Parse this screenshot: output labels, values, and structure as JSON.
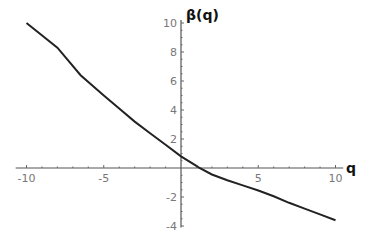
{
  "chart_data": {
    "type": "line",
    "title": "",
    "xlabel": "q",
    "ylabel": "β(q)",
    "xlim": [
      -10,
      10
    ],
    "ylim": [
      -4,
      10
    ],
    "grid": false,
    "legend": null,
    "x_ticks": [
      "-10",
      "-5",
      "5",
      "10"
    ],
    "y_ticks": [
      "10",
      "8",
      "6",
      "4",
      "2",
      "-2",
      "-4"
    ],
    "series": [
      {
        "name": "β(q)",
        "x": [
          -10,
          -8,
          -6.5,
          -5,
          -4,
          -3,
          -2,
          -1,
          0,
          1,
          1.2,
          2,
          3,
          4,
          5,
          6,
          7,
          8,
          9,
          10
        ],
        "y": [
          10,
          8.3,
          6.4,
          5.0,
          4.1,
          3.2,
          2.4,
          1.6,
          0.8,
          0.15,
          0,
          -0.45,
          -0.85,
          -1.2,
          -1.55,
          -1.95,
          -2.4,
          -2.8,
          -3.2,
          -3.6
        ]
      }
    ]
  }
}
